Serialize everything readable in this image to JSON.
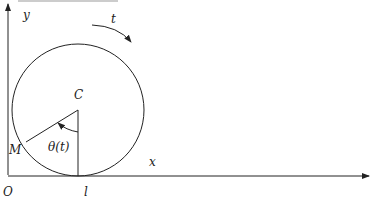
{
  "diagram": {
    "title_fragment": "... .. ... ......",
    "labels": {
      "y_axis": "y",
      "x_axis": "x",
      "origin": "O",
      "contact_point": "l",
      "center": "C",
      "point_on_circle": "M",
      "angle": "θ(t)",
      "time_direction": "t"
    },
    "colors": {
      "stroke": "#222222",
      "background": "#ffffff"
    }
  }
}
